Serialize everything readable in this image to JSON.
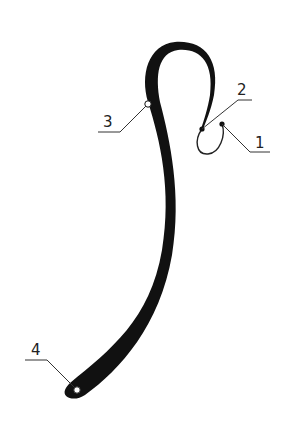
{
  "figure": {
    "type": "patent-line-drawing",
    "stroke_color": "#111111",
    "background": "#ffffff",
    "labels": [
      {
        "id": "1",
        "text": "1"
      },
      {
        "id": "2",
        "text": "2"
      },
      {
        "id": "3",
        "text": "3"
      },
      {
        "id": "4",
        "text": "4"
      }
    ]
  }
}
